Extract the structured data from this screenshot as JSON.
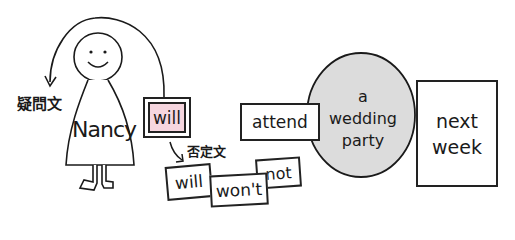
{
  "character": {
    "name": "Nancy"
  },
  "labels": {
    "question": "疑問文",
    "negative": "否定文"
  },
  "chips": {
    "will_main": "will",
    "will_neg": "will",
    "wont": "won't",
    "not": "not",
    "verb": "attend",
    "object_line1": "a",
    "object_line2": "wedding",
    "object_line3": "party",
    "time_line1": "next",
    "time_line2": "week"
  },
  "colors": {
    "ink": "#1a1a1a",
    "will_fill": "#f6d6df",
    "circle_fill": "#dcdcdc",
    "background": "#ffffff"
  }
}
